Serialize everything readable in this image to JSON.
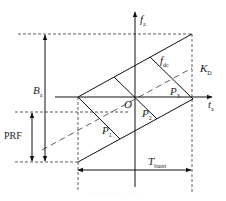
{
  "diagram": {
    "type": "TOPS burst azimuth time-frequency diagram",
    "axes": {
      "vertical": {
        "label_main": "f",
        "label_sub": "a"
      },
      "horizontal": {
        "label_main": "t",
        "label_sub": "a"
      }
    },
    "labels": {
      "bandwidth": {
        "main": "B",
        "sub": "a"
      },
      "prf": {
        "text": "PRF"
      },
      "origin": {
        "text": "O"
      },
      "doppler_centroid": {
        "main": "f",
        "sub": "dc"
      },
      "doppler_rate": {
        "main": "K",
        "sub": "D"
      },
      "p1": {
        "main": "P",
        "sub": "1"
      },
      "p2": {
        "main": "P",
        "sub": "2"
      },
      "p3": {
        "main": "P",
        "sub": "3"
      },
      "burst_time": {
        "main": "T",
        "sub": "burst"
      }
    },
    "caption": "· · · · · · · · · · · ·"
  }
}
